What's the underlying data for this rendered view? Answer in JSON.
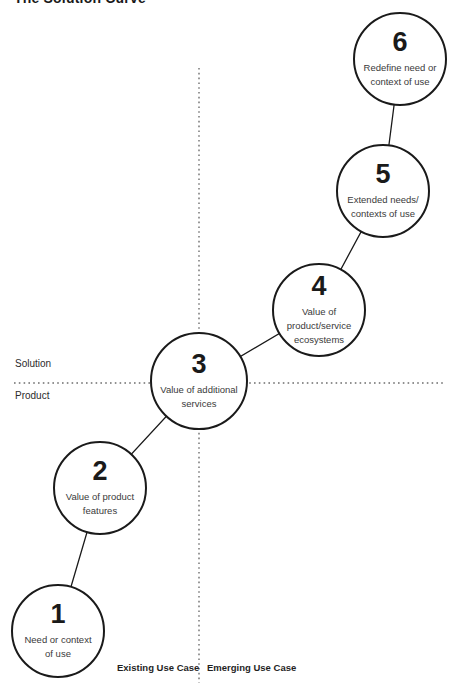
{
  "title": "The Solution Curve",
  "dividers": {
    "horizontal_above_label": "Solution",
    "horizontal_below_label": "Product",
    "vertical_left_label": "Existing Use Case",
    "vertical_right_label": "Emerging Use Case"
  },
  "colors": {
    "circle_stroke": "#1a1a1a",
    "connector": "#1a1a1a",
    "dotted_line": "#6e6e6e",
    "label_text": "#3a3a3a",
    "background": "#ffffff"
  },
  "steps": [
    {
      "number": "1",
      "lines": [
        "Need or context",
        "of use"
      ]
    },
    {
      "number": "2",
      "lines": [
        "Value of product",
        "features"
      ]
    },
    {
      "number": "3",
      "lines": [
        "Value of additional",
        "services"
      ]
    },
    {
      "number": "4",
      "lines": [
        "Value of",
        "product/service",
        "ecosystems"
      ]
    },
    {
      "number": "5",
      "lines": [
        "Extended needs/",
        "contexts of use"
      ]
    },
    {
      "number": "6",
      "lines": [
        "Redefine need or",
        "context of use"
      ]
    }
  ]
}
